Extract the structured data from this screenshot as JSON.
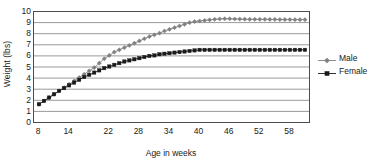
{
  "chart_data": {
    "type": "line",
    "title": "",
    "xlabel": "Age in weeks",
    "ylabel": "Weight (lbs)",
    "xlim": [
      7,
      62
    ],
    "ylim": [
      0,
      10
    ],
    "ytick_values": [
      0,
      1,
      2,
      3,
      4,
      5,
      6,
      7,
      8,
      9,
      10
    ],
    "ytick_labels": [
      "0",
      "1",
      "2",
      "3",
      "4",
      "5",
      "6",
      "7",
      "8",
      "9",
      "10"
    ],
    "xtick_values": [
      8,
      14,
      22,
      28,
      34,
      40,
      46,
      52,
      58
    ],
    "xtick_labels": [
      "8",
      "14",
      "22",
      "28",
      "34",
      "40",
      "46",
      "52",
      "58"
    ],
    "x_minor_step": 1,
    "grid": "horizontal",
    "legend_position": "right",
    "x": [
      8,
      9,
      10,
      11,
      12,
      13,
      14,
      15,
      16,
      17,
      18,
      19,
      20,
      21,
      22,
      23,
      24,
      25,
      26,
      27,
      28,
      29,
      30,
      31,
      32,
      33,
      34,
      35,
      36,
      37,
      38,
      39,
      40,
      41,
      42,
      43,
      44,
      45,
      46,
      47,
      48,
      49,
      50,
      51,
      52,
      53,
      54,
      55,
      56,
      57,
      58,
      59,
      60,
      61
    ],
    "series": [
      {
        "name": "Male",
        "color": "#808080",
        "marker": "diamond",
        "values": [
          1.6,
          1.9,
          2.2,
          2.5,
          2.8,
          3.1,
          3.4,
          3.7,
          4.0,
          4.3,
          4.6,
          4.9,
          5.3,
          5.7,
          6.0,
          6.3,
          6.5,
          6.7,
          6.9,
          7.1,
          7.3,
          7.5,
          7.7,
          7.85,
          8.0,
          8.2,
          8.35,
          8.5,
          8.65,
          8.8,
          8.95,
          9.05,
          9.1,
          9.15,
          9.2,
          9.25,
          9.28,
          9.3,
          9.3,
          9.28,
          9.27,
          9.26,
          9.25,
          9.25,
          9.25,
          9.25,
          9.24,
          9.24,
          9.23,
          9.23,
          9.23,
          9.22,
          9.22,
          9.22
        ]
      },
      {
        "name": "Female",
        "color": "#1a1a1a",
        "marker": "square",
        "values": [
          1.6,
          1.9,
          2.2,
          2.5,
          2.8,
          3.05,
          3.3,
          3.55,
          3.8,
          4.05,
          4.25,
          4.45,
          4.65,
          4.85,
          5.0,
          5.15,
          5.3,
          5.45,
          5.55,
          5.65,
          5.75,
          5.85,
          5.95,
          6.0,
          6.1,
          6.15,
          6.2,
          6.25,
          6.3,
          6.35,
          6.4,
          6.45,
          6.5,
          6.5,
          6.5,
          6.5,
          6.5,
          6.5,
          6.5,
          6.5,
          6.5,
          6.5,
          6.5,
          6.5,
          6.5,
          6.5,
          6.5,
          6.5,
          6.5,
          6.5,
          6.5,
          6.5,
          6.5,
          6.5
        ]
      }
    ]
  },
  "legend": {
    "items": [
      {
        "label": "Male"
      },
      {
        "label": "Female"
      }
    ]
  }
}
